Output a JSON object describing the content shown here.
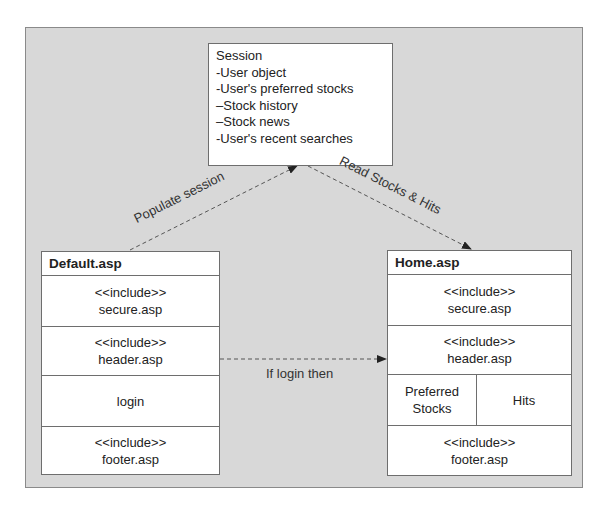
{
  "session": {
    "lines": [
      "Session",
      "-User object",
      "-User's preferred stocks",
      "–Stock history",
      "–Stock news",
      "-User's recent searches"
    ]
  },
  "default_page": {
    "title": "Default.asp",
    "rows": [
      {
        "line1": "<<include>>",
        "line2": "secure.asp"
      },
      {
        "line1": "<<include>>",
        "line2": "header.asp"
      },
      {
        "line1": "login"
      },
      {
        "line1": "<<include>>",
        "line2": "footer.asp"
      }
    ]
  },
  "home_page": {
    "title": "Home.asp",
    "rows": [
      {
        "line1": "<<include>>",
        "line2": "secure.asp"
      },
      {
        "line1": "<<include>>",
        "line2": "header.asp"
      },
      {
        "left_line1": "Preferred",
        "left_line2": "Stocks",
        "right": "Hits"
      },
      {
        "line1": "<<include>>",
        "line2": "footer.asp"
      }
    ]
  },
  "connectors": {
    "populate": "Populate session",
    "read": "Read Stocks & Hits",
    "if_login": "If login then"
  },
  "colors": {
    "frame_bg": "#d8d8d8",
    "box_bg": "#ffffff",
    "border": "#6e6e6e",
    "arrow": "#444444"
  }
}
